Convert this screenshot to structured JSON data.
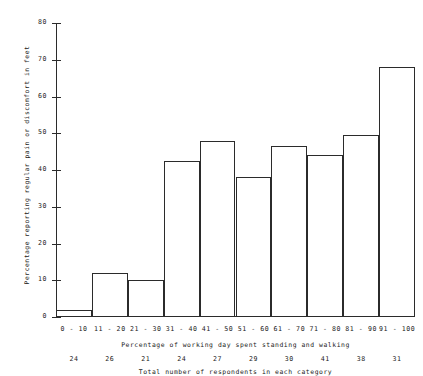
{
  "chart_data": {
    "type": "bar",
    "title": "",
    "subtitle": "",
    "xlabel": "Percentage of working day spent standing and walking",
    "ylabel": "Percentage reporting regular pain or discomfort in feet",
    "secondary_xlabel": "Total number of respondents in each category",
    "categories": [
      "0 - 10",
      "11 - 20",
      "21 - 30",
      "31 - 40",
      "41 - 50",
      "51 - 60",
      "61 - 70",
      "71 - 80",
      "81 - 90",
      "91 - 100"
    ],
    "values": [
      2,
      12,
      10,
      42.5,
      48,
      38,
      46.5,
      44,
      49.5,
      68
    ],
    "respondents": [
      24,
      26,
      21,
      24,
      27,
      29,
      30,
      41,
      38,
      31
    ],
    "ylim": [
      0,
      80
    ],
    "yticks": [
      0,
      10,
      20,
      30,
      40,
      50,
      60,
      70,
      80
    ],
    "ytick_labels": [
      "0",
      "10",
      "20",
      "30",
      "40",
      "50",
      "60",
      "70",
      "80"
    ],
    "grid": false,
    "legend": false,
    "bar_style": "outline",
    "bar_edge_color": "#2b2b2b",
    "bar_fill_color": "#ffffff",
    "axis_color": "#2b2b2b",
    "background_color": "#ffffff"
  }
}
